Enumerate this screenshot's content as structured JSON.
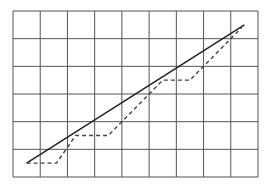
{
  "chart_data": {
    "type": "line",
    "title": "",
    "xlabel": "",
    "ylabel": "",
    "xlim": [
      0,
      9
    ],
    "ylim": [
      0,
      6
    ],
    "grid": true,
    "grid_columns": 9,
    "grid_rows": 6,
    "legend": null,
    "series": [
      {
        "name": "solid",
        "style": "solid",
        "color": "#222222",
        "points": [
          [
            0.5,
            0.5
          ],
          [
            8.5,
            5.5
          ]
        ]
      },
      {
        "name": "dashed",
        "style": "dashed",
        "color": "#444444",
        "points": [
          [
            0.5,
            0.5
          ],
          [
            1.6,
            0.5
          ],
          [
            2.3,
            1.5
          ],
          [
            3.5,
            1.5
          ],
          [
            5.5,
            3.5
          ],
          [
            6.5,
            3.5
          ],
          [
            8.4,
            5.4
          ]
        ]
      }
    ]
  },
  "colors": {
    "background": "#ffffff",
    "grid": "#555555"
  }
}
